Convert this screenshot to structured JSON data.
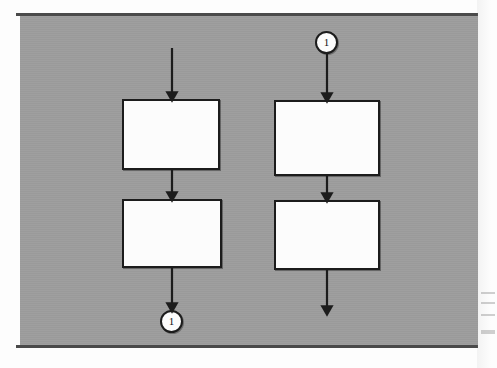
{
  "figure": {
    "type": "flowchart",
    "panel": {
      "background_color": "#9d9d9d",
      "rule_color": "#4a4a4a",
      "x": 20,
      "y": 13,
      "width": 458,
      "height": 335
    },
    "box_style": {
      "fill_color": "#fcfcfc",
      "border_color": "#1c1c1c"
    },
    "columns": [
      {
        "name": "left-column",
        "entry_arrow": {
          "label": "",
          "from_y": 48,
          "to_y": 99,
          "x": 172
        },
        "boxes": [
          {
            "name": "left-box-top",
            "label": "",
            "x": 122,
            "y": 99,
            "width": 98,
            "height": 71
          },
          {
            "name": "left-box-bottom",
            "label": "",
            "x": 122,
            "y": 199,
            "width": 100,
            "height": 69
          }
        ],
        "connector": {
          "name": "left-exit-connector",
          "label": "1",
          "cx": 172,
          "cy": 322
        }
      },
      {
        "name": "right-column",
        "connector": {
          "name": "right-entry-connector",
          "label": "1",
          "cx": 327,
          "cy": 42
        },
        "boxes": [
          {
            "name": "right-box-top",
            "label": "",
            "x": 274,
            "y": 100,
            "width": 106,
            "height": 76
          },
          {
            "name": "right-box-bottom",
            "label": "",
            "x": 274,
            "y": 200,
            "width": 106,
            "height": 70
          }
        ],
        "exit_arrow": {
          "label": "",
          "from_y": 270,
          "to_y": 313,
          "x": 327
        }
      }
    ],
    "connector_labels": [
      "1",
      "1"
    ]
  }
}
